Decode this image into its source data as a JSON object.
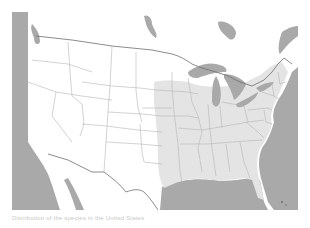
{
  "map": {
    "subject": "United States state outline map with shaded range",
    "colors": {
      "water": "#a9a9a9",
      "land": "#ffffff",
      "range_fill": "#e4e4e4",
      "state_border": "#b5b5b5",
      "country_border": "#6e6e6e"
    },
    "range_description": "Eastern United States shaded (from central plains/Texas east to Atlantic coast)"
  },
  "caption": {
    "text": "Distribution of the species in the United States"
  }
}
